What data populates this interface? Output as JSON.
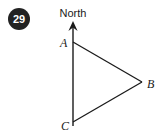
{
  "figure": {
    "question_number": "29",
    "direction_label": "North",
    "vertices": [
      {
        "name": "A",
        "label": "A",
        "x": 73,
        "y": 42,
        "label_x": 60,
        "label_y": 47
      },
      {
        "name": "B",
        "label": "B",
        "x": 142,
        "y": 82,
        "label_x": 147,
        "label_y": 88
      },
      {
        "name": "C",
        "label": "C",
        "x": 73,
        "y": 122,
        "label_x": 61,
        "label_y": 130
      }
    ],
    "colors": {
      "line": "#1a1a1a",
      "badge_fill": "#222222",
      "badge_text": "#ffffff",
      "background": "#ffffff",
      "text": "#1a1a1a"
    },
    "north_arrow": {
      "tip_x": 73,
      "tip_y": 22,
      "base_y": 125
    }
  }
}
